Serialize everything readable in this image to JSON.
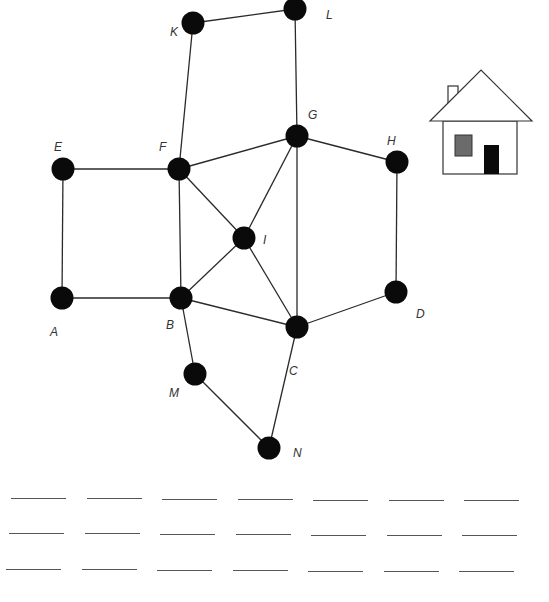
{
  "graph": {
    "nodes": [
      {
        "id": "K",
        "x": 193,
        "y": 23,
        "lx": 170,
        "ly": 25
      },
      {
        "id": "L",
        "x": 295,
        "y": 9,
        "lx": 326,
        "ly": 8
      },
      {
        "id": "G",
        "x": 297,
        "y": 136,
        "lx": 308,
        "ly": 108
      },
      {
        "id": "H",
        "x": 397,
        "y": 162,
        "lx": 387,
        "ly": 134
      },
      {
        "id": "E",
        "x": 63,
        "y": 169,
        "lx": 54,
        "ly": 140
      },
      {
        "id": "F",
        "x": 179,
        "y": 169,
        "lx": 159,
        "ly": 140
      },
      {
        "id": "I",
        "x": 244,
        "y": 238,
        "lx": 263,
        "ly": 233
      },
      {
        "id": "A",
        "x": 62,
        "y": 298,
        "lx": 50,
        "ly": 325
      },
      {
        "id": "B",
        "x": 181,
        "y": 298,
        "lx": 166,
        "ly": 318
      },
      {
        "id": "D",
        "x": 396,
        "y": 292,
        "lx": 416,
        "ly": 307
      },
      {
        "id": "C",
        "x": 297,
        "y": 327,
        "lx": 289,
        "ly": 364
      },
      {
        "id": "M",
        "x": 195,
        "y": 374,
        "lx": 169,
        "ly": 386
      },
      {
        "id": "N",
        "x": 269,
        "y": 448,
        "lx": 293,
        "ly": 446
      }
    ],
    "edges": [
      [
        "K",
        "L"
      ],
      [
        "K",
        "F"
      ],
      [
        "L",
        "G"
      ],
      [
        "E",
        "F"
      ],
      [
        "E",
        "A"
      ],
      [
        "A",
        "B"
      ],
      [
        "F",
        "B"
      ],
      [
        "F",
        "G"
      ],
      [
        "F",
        "I"
      ],
      [
        "G",
        "I"
      ],
      [
        "G",
        "H"
      ],
      [
        "G",
        "C"
      ],
      [
        "H",
        "D"
      ],
      [
        "D",
        "C"
      ],
      [
        "I",
        "B"
      ],
      [
        "I",
        "C"
      ],
      [
        "B",
        "C"
      ],
      [
        "B",
        "M"
      ],
      [
        "M",
        "N"
      ],
      [
        "C",
        "N"
      ]
    ]
  },
  "house": {
    "wall_color": "#ffffff",
    "window_color": "#6b6b6b",
    "door_color": "#0a0a0a"
  },
  "answer_blanks": {
    "rows": 3,
    "per_row": 7
  }
}
